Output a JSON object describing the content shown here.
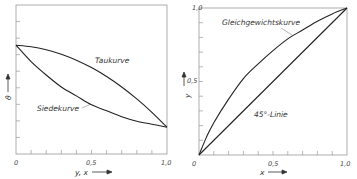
{
  "chart_data": [
    {
      "type": "line",
      "title": "",
      "xlabel": "y, x",
      "ylabel": "ϑ",
      "xlim": [
        0,
        1.0
      ],
      "ylim": [
        0,
        1.0
      ],
      "xticks": [
        "0",
        "0,5",
        "1,0"
      ],
      "yticks": [],
      "grid": false,
      "series": [
        {
          "name": "Taukurve",
          "x": [
            0,
            0.1,
            0.2,
            0.3,
            0.4,
            0.5,
            0.6,
            0.7,
            0.8,
            0.9,
            1.0
          ],
          "y": [
            0.73,
            0.72,
            0.7,
            0.67,
            0.63,
            0.58,
            0.52,
            0.45,
            0.37,
            0.28,
            0.18
          ]
        },
        {
          "name": "Siedekurve",
          "x": [
            0,
            0.1,
            0.2,
            0.3,
            0.4,
            0.5,
            0.6,
            0.7,
            0.8,
            0.9,
            1.0
          ],
          "y": [
            0.73,
            0.62,
            0.53,
            0.45,
            0.39,
            0.33,
            0.29,
            0.25,
            0.22,
            0.2,
            0.18
          ]
        }
      ],
      "annotations": [
        {
          "text": "Taukurve",
          "x": 0.52,
          "y": 0.62
        },
        {
          "text": "Siedekurve",
          "x": 0.14,
          "y": 0.3
        }
      ]
    },
    {
      "type": "line",
      "title": "",
      "xlabel": "x",
      "ylabel": "y",
      "xlim": [
        0,
        1.0
      ],
      "ylim": [
        0,
        1.0
      ],
      "xticks": [
        "0",
        "0,5",
        "1,0"
      ],
      "yticks": [
        "0,5",
        "1,0"
      ],
      "grid": false,
      "series": [
        {
          "name": "Gleichgewichtskurve",
          "x": [
            0,
            0.05,
            0.1,
            0.2,
            0.3,
            0.4,
            0.5,
            0.6,
            0.7,
            0.8,
            0.9,
            1.0
          ],
          "y": [
            0,
            0.12,
            0.22,
            0.38,
            0.52,
            0.62,
            0.71,
            0.79,
            0.85,
            0.91,
            0.96,
            1.0
          ]
        },
        {
          "name": "45°-Linie",
          "x": [
            0,
            1.0
          ],
          "y": [
            0,
            1.0
          ]
        }
      ],
      "annotations": [
        {
          "text": "Gleichgewichtskurve",
          "x": 0.16,
          "y": 0.9
        },
        {
          "text": "45°-Linie",
          "x": 0.38,
          "y": 0.3
        }
      ]
    }
  ]
}
